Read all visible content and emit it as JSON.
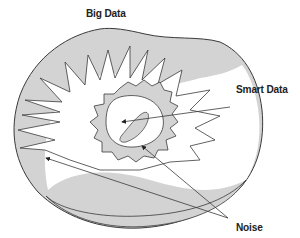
{
  "diagram": {
    "labels": {
      "big_data": "Big Data",
      "smart_data": "Smart Data",
      "noise": "Noise"
    },
    "colors": {
      "fill_gray": "#d3d3d3",
      "stroke": "#3a3a3a",
      "background": "#ffffff"
    }
  }
}
